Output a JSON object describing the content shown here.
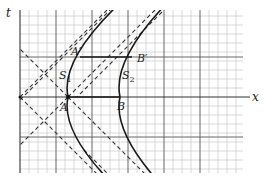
{
  "figure": {
    "axis_labels": {
      "t": "t",
      "x": "x"
    },
    "points": {
      "A": "A",
      "B": "B",
      "A_prime": "A′",
      "B_prime": "B′"
    },
    "curves": {
      "S1": "S",
      "S1_sub": "1",
      "S2": "S",
      "S2_sub": "2"
    },
    "colors": {
      "grid_minor": "#c8c8c8",
      "grid_major": "#555555",
      "curve": "#1a1a1a",
      "dashed": "#333333"
    }
  }
}
